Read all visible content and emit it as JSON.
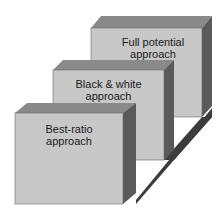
{
  "diagram": {
    "type": "stacked-3d-blocks",
    "colors": {
      "front": "#c8c8c8",
      "top": "#8a8a8a",
      "side": "#5a5a5a",
      "shadow": "#3c3c3c"
    },
    "blocks": [
      {
        "id": "full-potential",
        "label_line1": "Full potential",
        "label_line2": "approach"
      },
      {
        "id": "black-white",
        "label_line1": "Black & white",
        "label_line2": "approach"
      },
      {
        "id": "best-ratio",
        "label_line1": "Best-ratio",
        "label_line2": "approach"
      }
    ]
  }
}
